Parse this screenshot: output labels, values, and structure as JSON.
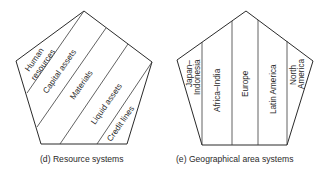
{
  "diagrams": [
    {
      "id": "d",
      "caption": "(d)  Resource systems",
      "segments": [
        {
          "label": "Human"
        },
        {
          "label": "resources"
        },
        {
          "label": "Capital assets"
        },
        {
          "label": "Materials"
        },
        {
          "label": "Liquid assets"
        },
        {
          "label": "Credit lines"
        }
      ]
    },
    {
      "id": "e",
      "caption": "(e)  Geographical area systems",
      "segments": [
        {
          "label": "Japan–"
        },
        {
          "label": "Indonesia"
        },
        {
          "label": "Africa–India"
        },
        {
          "label": "Europe"
        },
        {
          "label": "Latin America"
        },
        {
          "label": "North"
        },
        {
          "label": "America"
        }
      ]
    }
  ]
}
